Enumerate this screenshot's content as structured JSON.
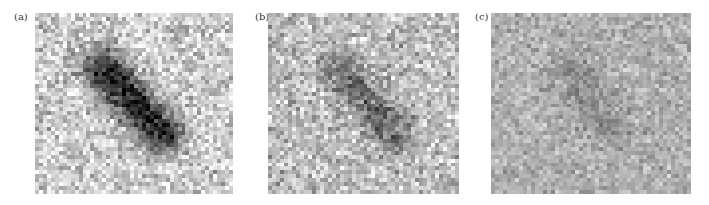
{
  "figure": {
    "background": "#ffffff",
    "panels": [
      {
        "label": "(a)",
        "label_pos": [
          14,
          11
        ],
        "rect": [
          35,
          13,
          198,
          181
        ],
        "grid": [
          50,
          46
        ],
        "base_gray": 205,
        "noise": 70,
        "contrast": 1.0,
        "target": {
          "x0": 0.34,
          "y0": 0.3,
          "x1": 0.64,
          "y1": 0.66,
          "width": 0.075,
          "darkness": 175
        }
      },
      {
        "label": "(b)",
        "label_pos": [
          255,
          11
        ],
        "rect": [
          268,
          13,
          191,
          181
        ],
        "grid": [
          48,
          46
        ],
        "base_gray": 190,
        "noise": 65,
        "contrast": 1.0,
        "target": {
          "x0": 0.38,
          "y0": 0.32,
          "x1": 0.66,
          "y1": 0.66,
          "width": 0.07,
          "darkness": 85
        }
      },
      {
        "label": "(c)",
        "label_pos": [
          475,
          11
        ],
        "rect": [
          491,
          13,
          200,
          181
        ],
        "grid": [
          50,
          46
        ],
        "base_gray": 175,
        "noise": 42,
        "contrast": 1.0,
        "target": {
          "x0": 0.4,
          "y0": 0.3,
          "x1": 0.58,
          "y1": 0.62,
          "width": 0.07,
          "darkness": 35
        }
      }
    ]
  }
}
